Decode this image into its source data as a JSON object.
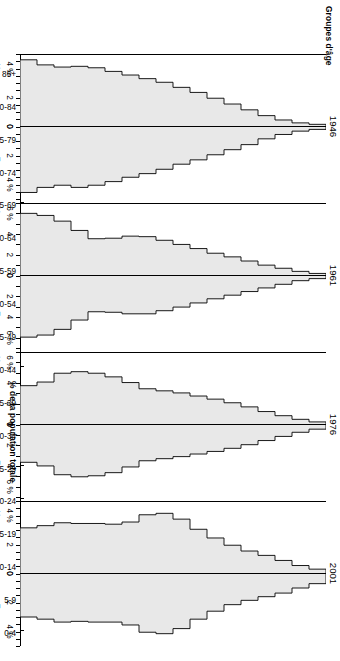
{
  "figure": {
    "y_axis_title": "Groupes d'âge",
    "x_axis_title": "% de la population totale",
    "background": "#ffffff",
    "fill_color": "#e8e8e8",
    "line_color": "#000000"
  },
  "age_groups": [
    "85+",
    "80-84",
    "75-79",
    "70-74",
    "65-69",
    "60-64",
    "55-59",
    "50-54",
    "45-49",
    "40-44",
    "35-39",
    "30-34",
    "25-29",
    "20-24",
    "15-19",
    "10-14",
    "5-9",
    "0-4"
  ],
  "side_labels": {
    "left": "Hommes",
    "right": "Femmes"
  },
  "panels": [
    {
      "year": "1946",
      "axis_max": 5,
      "ticks_left": [
        {
          "v": 4,
          "label": "4 %"
        },
        {
          "v": 2,
          "label": "2"
        },
        {
          "v": 0,
          "label": "0"
        }
      ],
      "ticks_right": [
        {
          "v": 0,
          "label": "0"
        },
        {
          "v": 2,
          "label": "2"
        },
        {
          "v": 4,
          "label": "4 %"
        }
      ],
      "minor_ticks": [
        5,
        4.5,
        4,
        3.5,
        3,
        2.5,
        2,
        1.5,
        1,
        0.5,
        0
      ],
      "hommes_label_at": 3.2,
      "femmes_label_at": 3.2
    },
    {
      "year": "1961",
      "axis_max": 7,
      "ticks_left": [
        {
          "v": 6,
          "label": "6 %"
        },
        {
          "v": 4,
          "label": "4"
        },
        {
          "v": 2,
          "label": "2"
        },
        {
          "v": 0,
          "label": "0"
        }
      ],
      "ticks_right": [
        {
          "v": 0,
          "label": "0"
        },
        {
          "v": 2,
          "label": "2"
        },
        {
          "v": 4,
          "label": "4"
        },
        {
          "v": 6,
          "label": "6 %"
        }
      ],
      "minor_ticks": [
        7,
        6,
        5,
        4,
        3,
        2,
        1,
        0
      ],
      "hommes_label_at": 5.0,
      "femmes_label_at": 5.0
    },
    {
      "year": "1976",
      "axis_max": 7,
      "ticks_left": [
        {
          "v": 6,
          "label": "6 %"
        },
        {
          "v": 4,
          "label": "4"
        },
        {
          "v": 2,
          "label": "2"
        },
        {
          "v": 0,
          "label": "0"
        }
      ],
      "ticks_right": [
        {
          "v": 0,
          "label": "0"
        },
        {
          "v": 2,
          "label": "2"
        },
        {
          "v": 4,
          "label": "4"
        },
        {
          "v": 6,
          "label": "6 %"
        }
      ],
      "minor_ticks": [
        7,
        6,
        5,
        4,
        3,
        2,
        1,
        0
      ],
      "hommes_label_at": 5.0,
      "femmes_label_at": 5.0
    },
    {
      "year": "2001",
      "axis_max": 5,
      "ticks_left": [
        {
          "v": 4,
          "label": "4 %"
        },
        {
          "v": 2,
          "label": "2"
        },
        {
          "v": 0,
          "label": "0"
        }
      ],
      "ticks_right": [
        {
          "v": 0,
          "label": "0"
        },
        {
          "v": 2,
          "label": "2"
        },
        {
          "v": 4,
          "label": "4 %"
        }
      ],
      "minor_ticks": [
        5,
        4.5,
        4,
        3.5,
        3,
        2.5,
        2,
        1.5,
        1,
        0.5,
        0
      ],
      "hommes_label_at": 3.2,
      "femmes_label_at": 3.2
    }
  ],
  "chart_data": {
    "type": "bar",
    "xlabel": "% de la population totale",
    "ylabel": "Groupes d'âge",
    "orientation": "population-pyramid",
    "categories": [
      "85+",
      "80-84",
      "75-79",
      "70-74",
      "65-69",
      "60-64",
      "55-59",
      "50-54",
      "45-49",
      "40-44",
      "35-39",
      "30-34",
      "25-29",
      "20-24",
      "15-19",
      "10-14",
      "5-9",
      "0-4"
    ],
    "grid": false,
    "legend": "none",
    "panels": [
      {
        "year": "1946",
        "xlim": [
          -5,
          5
        ],
        "series": [
          {
            "name": "Hommes",
            "values": [
              0.15,
              0.25,
              0.45,
              0.75,
              1.15,
              1.55,
              1.95,
              2.35,
              2.7,
              3.05,
              3.3,
              3.55,
              3.8,
              4.05,
              4.15,
              4.1,
              4.25,
              4.6
            ]
          },
          {
            "name": "Femmes",
            "values": [
              0.2,
              0.32,
              0.55,
              0.85,
              1.25,
              1.6,
              1.95,
              2.3,
              2.6,
              2.95,
              3.25,
              3.5,
              3.8,
              4.05,
              4.2,
              4.05,
              4.2,
              4.55
            ]
          }
        ]
      },
      {
        "year": "1961",
        "xlim": [
          -7,
          7
        ],
        "series": [
          {
            "name": "Hommes",
            "values": [
              0.2,
              0.4,
              0.7,
              1.0,
              1.4,
              1.8,
              2.15,
              2.6,
              3.0,
              3.4,
              3.75,
              3.8,
              3.6,
              3.55,
              4.35,
              5.25,
              5.8,
              6.0
            ]
          },
          {
            "name": "Femmes",
            "values": [
              0.3,
              0.5,
              0.85,
              1.2,
              1.55,
              1.9,
              2.25,
              2.65,
              3.05,
              3.4,
              3.7,
              3.7,
              3.55,
              3.5,
              4.3,
              5.2,
              5.75,
              5.95
            ]
          }
        ]
      },
      {
        "year": "1976",
        "xlim": [
          -7,
          7
        ],
        "series": [
          {
            "name": "Hommes",
            "values": [
              0.25,
              0.5,
              0.85,
              1.25,
              1.7,
              2.1,
              2.45,
              2.75,
              3.05,
              3.25,
              3.45,
              4.05,
              4.6,
              4.95,
              5.1,
              4.95,
              4.1,
              3.75
            ]
          },
          {
            "name": "Femmes",
            "values": [
              0.45,
              0.75,
              1.15,
              1.55,
              1.95,
              2.3,
              2.6,
              2.85,
              3.1,
              3.3,
              3.5,
              4.1,
              4.65,
              4.95,
              5.05,
              4.85,
              4.0,
              3.65
            ]
          }
        ]
      },
      {
        "year": "2001",
        "xlim": [
          -5,
          5
        ],
        "series": [
          {
            "name": "Hommes",
            "values": [
              0.3,
              0.55,
              0.9,
              1.25,
              1.55,
              1.95,
              2.45,
              3.05,
              3.75,
              4.15,
              4.05,
              3.55,
              3.4,
              3.45,
              3.45,
              3.5,
              3.3,
              3.15
            ]
          },
          {
            "name": "Femmes",
            "values": [
              0.7,
              1.0,
              1.35,
              1.6,
              1.85,
              2.15,
              2.6,
              3.15,
              3.8,
              4.15,
              4.05,
              3.55,
              3.35,
              3.35,
              3.3,
              3.35,
              3.15,
              3.0
            ]
          }
        ]
      }
    ]
  }
}
